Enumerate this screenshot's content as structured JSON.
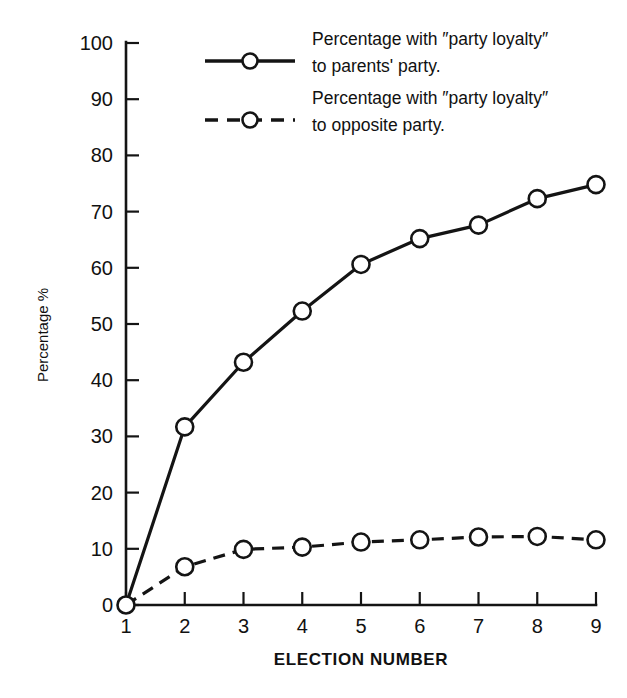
{
  "chart_data": {
    "type": "line",
    "title": "",
    "subtitle": "",
    "xlabel": "ELECTION NUMBER",
    "ylabel": "Percentage %",
    "x": [
      1,
      2,
      3,
      4,
      5,
      6,
      7,
      8,
      9
    ],
    "xtick_labels": [
      "1",
      "2",
      "3",
      "4",
      "5",
      "6",
      "7",
      "8",
      "9"
    ],
    "ytick_labels": [
      "0",
      "10",
      "20",
      "30",
      "40",
      "50",
      "60",
      "70",
      "80",
      "90",
      "100"
    ],
    "yticks": [
      0,
      10,
      20,
      30,
      40,
      50,
      60,
      70,
      80,
      90,
      100
    ],
    "xlim": [
      1,
      9
    ],
    "ylim": [
      0,
      100
    ],
    "grid": false,
    "legend_position": "top-center",
    "series": [
      {
        "name": "Percentage with ''party loyalty'' to parents' party.",
        "style": "solid",
        "marker": "open-circle",
        "color": "#141414",
        "values": [
          0,
          31.7,
          43.2,
          52.3,
          60.6,
          65.2,
          67.6,
          72.3,
          74.8
        ]
      },
      {
        "name": "Percentage with ''party loyalty'' to opposite party.",
        "style": "dashed",
        "marker": "open-circle",
        "color": "#141414",
        "values": [
          0,
          6.8,
          9.9,
          10.3,
          11.2,
          11.6,
          12.1,
          12.2,
          11.6
        ]
      }
    ]
  },
  "legend": {
    "entries": [
      {
        "line1": "Percentage with ″party loyalty″",
        "line2": "to parents' party."
      },
      {
        "line1": "Percentage with ″party loyalty″",
        "line2": "to opposite party."
      }
    ]
  },
  "axes": {
    "x_title": "ELECTION NUMBER",
    "y_title": "Percentage %"
  }
}
